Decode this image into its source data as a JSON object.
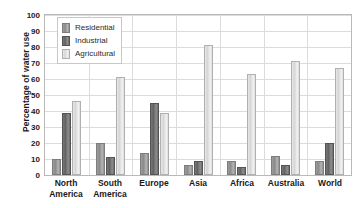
{
  "chart_data": {
    "type": "bar",
    "title": "",
    "xlabel": "",
    "ylabel": "Percentage of water use",
    "ylim": [
      0,
      100
    ],
    "ytick_step": 10,
    "yticks": [
      100,
      90,
      80,
      70,
      60,
      50,
      40,
      30,
      20,
      10,
      0
    ],
    "grid": true,
    "legend_position": "top-left-inside",
    "categories": [
      "North America",
      "South America",
      "Europe",
      "Asia",
      "Africa",
      "Australia",
      "World"
    ],
    "category_lines": [
      [
        "North",
        "America"
      ],
      [
        "South",
        "America"
      ],
      [
        "Europe"
      ],
      [
        "Asia"
      ],
      [
        "Africa"
      ],
      [
        "Australia"
      ],
      [
        "World"
      ]
    ],
    "series": [
      {
        "name": "Residential",
        "color": "#8f8f8f",
        "values": [
          10,
          20,
          14,
          6,
          9,
          12,
          9
        ]
      },
      {
        "name": "Industrial",
        "color": "#636363",
        "values": [
          39,
          11,
          45,
          9,
          5,
          6,
          20
        ]
      },
      {
        "name": "Agricultural",
        "color": "#e0e0e0",
        "values": [
          46,
          61,
          39,
          81,
          63,
          71,
          67
        ]
      }
    ]
  },
  "legend": {
    "items": [
      {
        "label": "Residential",
        "key": "residential"
      },
      {
        "label": "Industrial",
        "key": "industrial"
      },
      {
        "label": "Agricultural",
        "key": "agricultural"
      }
    ]
  },
  "colors": {
    "plot_border": "#b9b9b9",
    "gridline": "#dcdcdc",
    "text": "#1a1a1a",
    "background": "#ffffff"
  }
}
